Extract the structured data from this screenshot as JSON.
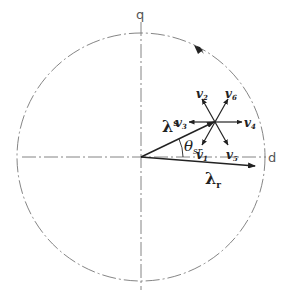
{
  "figure": {
    "axes": {
      "q_label": "q",
      "d_label": "d"
    },
    "vectors": {
      "lambda_s": {
        "symbol": "λ",
        "subscript": "s"
      },
      "lambda_r": {
        "symbol": "λ",
        "subscript": "r"
      }
    },
    "angle": {
      "symbol": "θ",
      "subscript": "sr"
    },
    "voltage_vectors": [
      {
        "symbol": "v",
        "subscript": "1"
      },
      {
        "symbol": "v",
        "subscript": "2"
      },
      {
        "symbol": "v",
        "subscript": "3"
      },
      {
        "symbol": "v",
        "subscript": "4"
      },
      {
        "symbol": "v",
        "subscript": "5"
      },
      {
        "symbol": "v",
        "subscript": "6"
      }
    ],
    "colors": {
      "stroke": "#222222",
      "dashed": "#777777"
    }
  }
}
